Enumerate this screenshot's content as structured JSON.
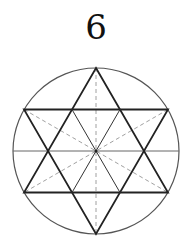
{
  "figure": {
    "label": "6"
  },
  "geometry": {
    "center": [
      96,
      151
    ],
    "radius": 83,
    "vertices": {
      "top": [
        96,
        68
      ],
      "upper_right": [
        168,
        109.5
      ],
      "lower_right": [
        168,
        192.5
      ],
      "bottom": [
        96,
        234
      ],
      "lower_left": [
        24,
        192.5
      ],
      "upper_left": [
        24,
        109.5
      ]
    },
    "horizontal_diameter_y": 151
  },
  "colors": {
    "circle": "#555555",
    "star": "#222222",
    "horizontal_line": "#666666",
    "dashed": "#888888"
  }
}
